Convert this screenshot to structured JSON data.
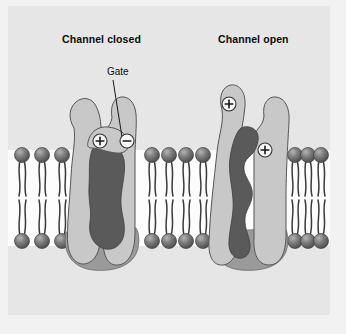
{
  "figure": {
    "type": "biology-diagram",
    "background_color": "#e6e6e6",
    "outer_color": "#f2f2f2"
  },
  "labels": {
    "channel_closed": "Channel closed",
    "channel_open": "Channel open",
    "gate": "Gate"
  },
  "charges": {
    "closed_channel": [
      {
        "symbol": "+",
        "name": "positive-charge-closed"
      },
      {
        "symbol": "−",
        "name": "negative-charge-closed"
      }
    ],
    "open_channel": [
      {
        "symbol": "+",
        "name": "positive-charge-open-upper"
      },
      {
        "symbol": "+",
        "name": "positive-charge-open-lower"
      }
    ]
  },
  "membrane": {
    "segments": [
      {
        "name": "bilayer-left",
        "lipid_pairs": 3
      },
      {
        "name": "bilayer-middle",
        "lipid_pairs": 4
      },
      {
        "name": "bilayer-right",
        "lipid_pairs": 3
      }
    ],
    "head_color": "#6e6e6e",
    "tail_color": "#3a3a3a",
    "interior_color": "#ffffff"
  },
  "colors": {
    "protein_light": "#c8c8c8",
    "protein_outline": "#555555",
    "pore_dark": "#5a5a5a",
    "protein_base_shadow": "#9a9a9a",
    "text": "#0d0d0d"
  },
  "channels": [
    {
      "name": "closed-channel",
      "state": "closed",
      "description": "Gate flap folded over the pore, blocking the dark central channel"
    },
    {
      "name": "open-channel",
      "state": "open",
      "description": "Subunits separated, dark central pore continuous through the membrane"
    }
  ]
}
